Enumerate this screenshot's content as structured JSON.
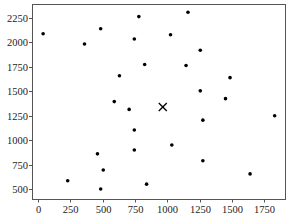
{
  "chart_data": {
    "type": "scatter",
    "title": "",
    "xlabel": "",
    "ylabel": "",
    "xlim": [
      -46,
      1910
    ],
    "ylim": [
      398,
      2394
    ],
    "x_ticks": [
      0,
      250,
      500,
      750,
      1000,
      1250,
      1500,
      1750
    ],
    "x_tick_labels": [
      "0",
      "250",
      "500",
      "750",
      "1000",
      "1250",
      "1500",
      "1750"
    ],
    "y_ticks": [
      500,
      750,
      1000,
      1250,
      1500,
      1750,
      2000,
      2250
    ],
    "y_tick_labels": [
      "500",
      "750",
      "1000",
      "1250",
      "1500",
      "1750",
      "2000",
      "2250"
    ],
    "grid": false,
    "legend": null,
    "series": [
      {
        "name": "points",
        "marker": "dot",
        "color": "#000000",
        "points": [
          {
            "x": 40,
            "y": 2090
          },
          {
            "x": 485,
            "y": 2140
          },
          {
            "x": 360,
            "y": 1985
          },
          {
            "x": 780,
            "y": 2265
          },
          {
            "x": 1160,
            "y": 2310
          },
          {
            "x": 745,
            "y": 2035
          },
          {
            "x": 1025,
            "y": 2080
          },
          {
            "x": 1255,
            "y": 1920
          },
          {
            "x": 825,
            "y": 1775
          },
          {
            "x": 1145,
            "y": 1765
          },
          {
            "x": 630,
            "y": 1660
          },
          {
            "x": 590,
            "y": 1395
          },
          {
            "x": 1255,
            "y": 1505
          },
          {
            "x": 705,
            "y": 1315
          },
          {
            "x": 1485,
            "y": 1640
          },
          {
            "x": 1450,
            "y": 1425
          },
          {
            "x": 1830,
            "y": 1250
          },
          {
            "x": 1275,
            "y": 1205
          },
          {
            "x": 745,
            "y": 1105
          },
          {
            "x": 460,
            "y": 860
          },
          {
            "x": 745,
            "y": 900
          },
          {
            "x": 1035,
            "y": 950
          },
          {
            "x": 505,
            "y": 695
          },
          {
            "x": 230,
            "y": 585
          },
          {
            "x": 485,
            "y": 500
          },
          {
            "x": 840,
            "y": 550
          },
          {
            "x": 1275,
            "y": 790
          },
          {
            "x": 1640,
            "y": 655
          }
        ]
      },
      {
        "name": "center",
        "marker": "x",
        "color": "#000000",
        "points": [
          {
            "x": 965,
            "y": 1340
          }
        ]
      }
    ]
  },
  "layout": {
    "plot_left": 32,
    "plot_top": 4,
    "plot_right": 285,
    "plot_bottom": 199
  }
}
